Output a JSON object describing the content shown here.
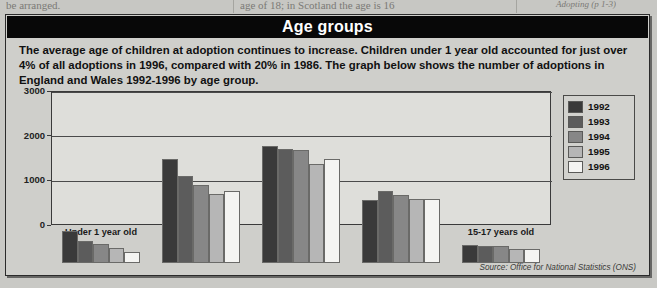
{
  "page_bleed": {
    "left_text": "be arranged.",
    "middle_text": "age of 18; in Scotland the age is 16",
    "right_text": "Adopting (p 1-3)"
  },
  "panel": {
    "title": "Age groups",
    "intro": "The average age of children at adoption continues to increase. Children under 1 year old accounted for just over 4% of all adoptions in 1996, compared with 20% in 1986. The graph below shows the number of adoptions in England and Wales 1992-1996 by age group.",
    "source": "Source: Office for National Statistics (ONS)"
  },
  "colors": {
    "title_bar": "#080808",
    "panel_bg": "#cfcfcb",
    "plot_bg": "#dededa",
    "series_1992": "#3a3a3a",
    "series_1993": "#5c5c5c",
    "series_1994": "#878787",
    "series_1995": "#b6b6b6",
    "series_1996": "#f4f4f2"
  },
  "chart_data": {
    "type": "bar",
    "title": "Age groups",
    "xlabel": "",
    "ylabel": "",
    "ylim": [
      0,
      3000
    ],
    "yticks": [
      0,
      1000,
      2000,
      3000
    ],
    "grid": true,
    "legend_position": "right",
    "categories": [
      "Under 1 year old",
      "1-4 years old",
      "5-9 years old",
      "10-14 years old",
      "15-17 years old"
    ],
    "series": [
      {
        "name": "1992",
        "color": "#3a3a3a",
        "values": [
          720,
          2320,
          2620,
          1420,
          400
        ]
      },
      {
        "name": "1993",
        "color": "#5c5c5c",
        "values": [
          500,
          1940,
          2560,
          1620,
          390
        ]
      },
      {
        "name": "1994",
        "color": "#878787",
        "values": [
          420,
          1740,
          2530,
          1520,
          380
        ]
      },
      {
        "name": "1995",
        "color": "#b6b6b6",
        "values": [
          330,
          1540,
          2220,
          1440,
          320
        ]
      },
      {
        "name": "1996",
        "color": "#f4f4f2",
        "values": [
          250,
          1610,
          2320,
          1430,
          310
        ]
      }
    ]
  }
}
